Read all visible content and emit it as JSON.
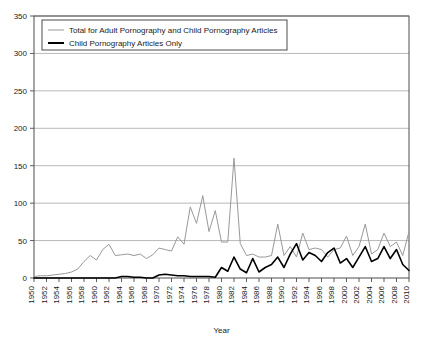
{
  "chart_data": {
    "type": "line",
    "title": "",
    "xlabel": "Year",
    "ylabel": "",
    "xlim": [
      1950,
      2010
    ],
    "ylim": [
      0,
      350
    ],
    "ytick_step": 50,
    "xtick_step": 2,
    "grid": true,
    "legend_position": "top-left",
    "yticks": [
      0,
      50,
      100,
      150,
      200,
      250,
      300,
      350
    ],
    "xticks": [
      1950,
      1952,
      1954,
      1956,
      1958,
      1960,
      1962,
      1964,
      1966,
      1968,
      1970,
      1972,
      1974,
      1976,
      1978,
      1980,
      1982,
      1984,
      1986,
      1988,
      1990,
      1992,
      1994,
      1996,
      1998,
      2000,
      2002,
      2004,
      2006,
      2008,
      2010
    ],
    "x": [
      1950,
      1951,
      1952,
      1953,
      1954,
      1955,
      1956,
      1957,
      1958,
      1959,
      1960,
      1961,
      1962,
      1963,
      1964,
      1965,
      1966,
      1967,
      1968,
      1969,
      1970,
      1971,
      1972,
      1973,
      1974,
      1975,
      1976,
      1977,
      1978,
      1979,
      1980,
      1981,
      1982,
      1983,
      1984,
      1985,
      1986,
      1987,
      1988,
      1989,
      1990,
      1991,
      1992,
      1993,
      1994,
      1995,
      1996,
      1997,
      1998,
      1999,
      2000,
      2001,
      2002,
      2003,
      2004,
      2005,
      2006,
      2007,
      2008,
      2009,
      2010
    ],
    "series": [
      {
        "name": "Total for Adult Pornography and Child Pornography Articles",
        "color": "#999999",
        "width": 1,
        "values": [
          2,
          3,
          3,
          4,
          5,
          6,
          8,
          12,
          22,
          30,
          24,
          38,
          45,
          30,
          31,
          32,
          30,
          32,
          26,
          31,
          40,
          38,
          36,
          55,
          45,
          95,
          73,
          110,
          62,
          90,
          48,
          48,
          160,
          46,
          30,
          32,
          28,
          28,
          30,
          72,
          30,
          42,
          28,
          60,
          38,
          40,
          38,
          28,
          38,
          40,
          56,
          30,
          42,
          72,
          32,
          38,
          60,
          42,
          48,
          30,
          62
        ]
      },
      {
        "name": "Child Pornography Articles Only",
        "color": "#000000",
        "width": 1.6,
        "values": [
          0,
          0,
          0,
          0,
          0,
          0,
          0,
          0,
          0,
          0,
          0,
          0,
          0,
          0,
          2,
          2,
          1,
          1,
          0,
          0,
          4,
          5,
          4,
          3,
          3,
          2,
          2,
          2,
          2,
          1,
          1,
          2,
          2,
          2,
          2,
          1,
          1,
          1,
          2,
          1,
          2,
          48,
          10,
          6,
          4,
          5,
          4,
          12,
          6,
          30,
          8,
          10,
          5,
          12,
          18,
          22,
          14,
          30,
          52,
          10,
          16
        ]
      }
    ],
    "series_late_black": [
      14,
      9,
      28,
      12,
      7,
      26,
      8,
      14,
      18,
      28,
      14,
      32,
      46,
      24,
      34,
      30,
      22,
      34,
      40,
      20,
      26,
      14,
      28,
      42,
      22,
      26,
      42,
      26,
      38,
      18,
      10
    ]
  },
  "legend": {
    "items": [
      {
        "label": "Total for Adult Pornography and Child Pornography Articles",
        "color": "#999999",
        "thickness": 1
      },
      {
        "label": "Child Pornography Articles Only",
        "color": "#000000",
        "thickness": 2
      }
    ]
  },
  "colors": {
    "axis": "#4d4d4d",
    "grid": "#9a9a9a",
    "text": "#1a1a1a",
    "background": "#ffffff",
    "total_series": "#999999",
    "child_series": "#000000"
  }
}
